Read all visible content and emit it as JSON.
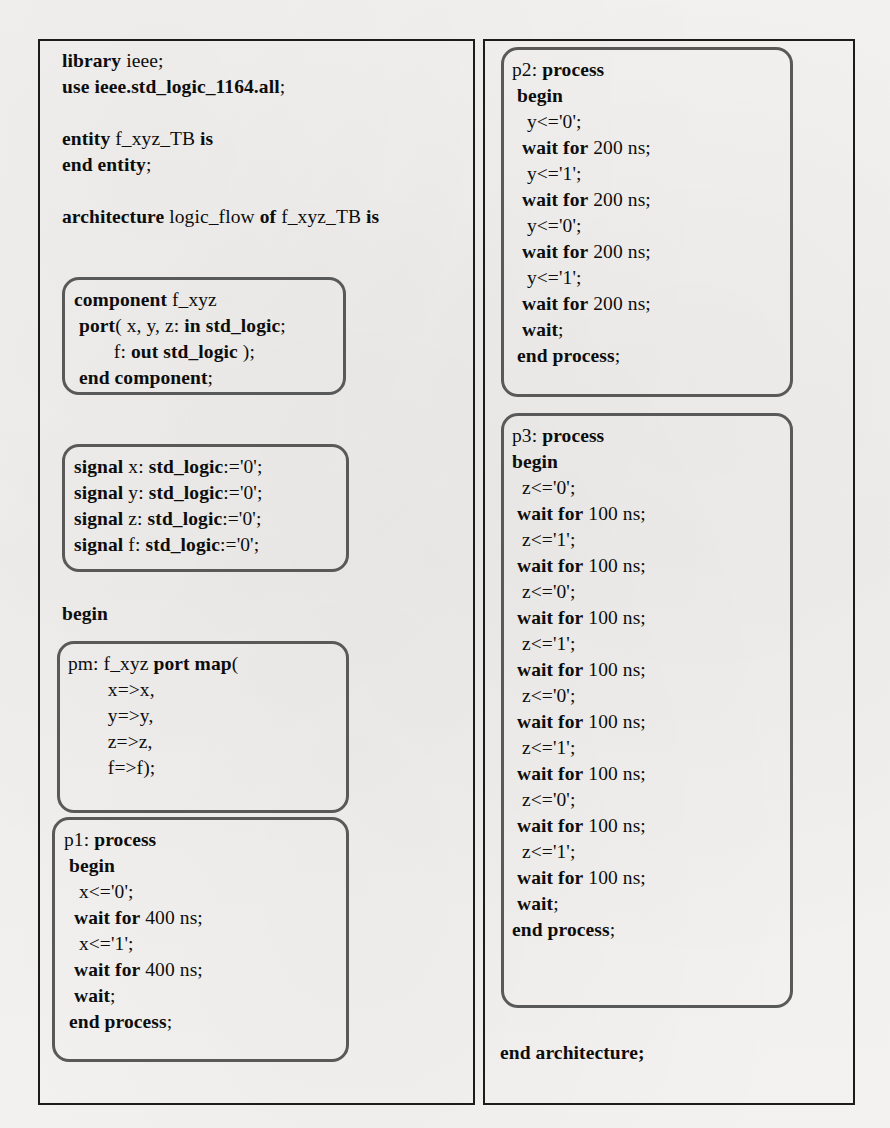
{
  "document": {
    "kind": "vhdl-testbench-listing",
    "language": "VHDL"
  },
  "left_panel": {
    "header_lines": [
      "library ieee;",
      "use ieee.std_logic_1164.all;",
      "",
      "entity f_xyz_TB is",
      "end entity;",
      "",
      "architecture logic_flow of f_xyz_TB is"
    ],
    "header_text": "library ieee;\nuse ieee.std_logic_1164.all;\n\nentity f_xyz_TB is\nend entity;\n\narchitecture logic_flow of f_xyz_TB is",
    "component_block": {
      "label": "component-declaration",
      "lines": [
        "component f_xyz",
        " port( x, y, z: in std_logic;",
        "        f: out std_logic );",
        " end component;"
      ],
      "text": "component f_xyz\n port( x, y, z: in std_logic;\n        f: out std_logic );\n end component;"
    },
    "signal_block": {
      "label": "signal-declarations",
      "lines": [
        "signal x: std_logic:='0';",
        "signal y: std_logic:='0';",
        "signal z: std_logic:='0';",
        "signal f: std_logic:='0';"
      ],
      "text": "signal x: std_logic:='0';\nsignal y: std_logic:='0';\nsignal z: std_logic:='0';\nsignal f: std_logic:='0';"
    },
    "begin_keyword": "begin",
    "portmap_block": {
      "label": "port-map-instantiation",
      "lines": [
        "pm: f_xyz port map(",
        "        x=>x,",
        "        y=>y,",
        "        z=>z,",
        "        f=>f);"
      ],
      "text": "pm: f_xyz port map(\n        x=>x,\n        y=>y,\n        z=>z,\n        f=>f);"
    },
    "p1_block": {
      "label": "process-p1",
      "lines": [
        "p1: process",
        " begin",
        "   x<='0';",
        "  wait for 400 ns;",
        "   x<='1';",
        "  wait for 400 ns;",
        "  wait;",
        " end process;"
      ],
      "text": "p1: process\n begin\n   x<='0';\n  wait for 400 ns;\n   x<='1';\n  wait for 400 ns;\n  wait;\n end process;"
    }
  },
  "right_panel": {
    "p2_block": {
      "label": "process-p2",
      "lines": [
        "p2: process",
        " begin",
        "   y<='0';",
        "  wait for 200 ns;",
        "   y<='1';",
        "  wait for 200 ns;",
        "   y<='0';",
        "  wait for 200 ns;",
        "   y<='1';",
        "  wait for 200 ns;",
        "  wait;",
        " end process;"
      ],
      "text": "p2: process\n begin\n   y<='0';\n  wait for 200 ns;\n   y<='1';\n  wait for 200 ns;\n   y<='0';\n  wait for 200 ns;\n   y<='1';\n  wait for 200 ns;\n  wait;\n end process;"
    },
    "p3_block": {
      "label": "process-p3",
      "lines": [
        "p3: process",
        "begin",
        "  z<='0';",
        " wait for 100 ns;",
        "  z<='1';",
        " wait for 100 ns;",
        "  z<='0';",
        " wait for 100 ns;",
        "  z<='1';",
        " wait for 100 ns;",
        "  z<='0';",
        " wait for 100 ns;",
        "  z<='1';",
        " wait for 100 ns;",
        "  z<='0';",
        " wait for 100 ns;",
        "  z<='1';",
        " wait for 100 ns;",
        " wait;",
        "end process;"
      ],
      "text": "p3: process\nbegin\n  z<='0';\n wait for 100 ns;\n  z<='1';\n wait for 100 ns;\n  z<='0';\n wait for 100 ns;\n  z<='1';\n wait for 100 ns;\n  z<='0';\n wait for 100 ns;\n  z<='1';\n wait for 100 ns;\n  z<='0';\n wait for 100 ns;\n  z<='1';\n wait for 100 ns;\n wait;\nend process;"
    },
    "end_architecture": "end architecture;"
  },
  "colors": {
    "page_background": "#f2f1ef",
    "text": "#0d0d0d",
    "frame_border": "#1c1c1c",
    "roundbox_border": "#595959"
  },
  "keywords": [
    "library",
    "use",
    "entity",
    "end",
    "architecture",
    "component",
    "port",
    "in",
    "out",
    "std_logic",
    "signal",
    "begin",
    "process",
    "wait",
    "for",
    "port map",
    "end process",
    "end entity",
    "end component",
    "end architecture"
  ]
}
